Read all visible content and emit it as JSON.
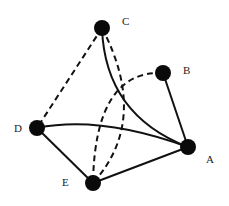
{
  "diagram": {
    "type": "graph",
    "nodes": [
      {
        "id": "A",
        "label": "A",
        "x": 188,
        "y": 147,
        "lx": 206,
        "ly": 163
      },
      {
        "id": "B",
        "label": "B",
        "x": 163,
        "y": 73,
        "lx": 183,
        "ly": 74
      },
      {
        "id": "C",
        "label": "C",
        "x": 102,
        "y": 28,
        "lx": 122,
        "ly": 25
      },
      {
        "id": "D",
        "label": "D",
        "x": 37,
        "y": 128,
        "lx": 14,
        "ly": 132
      },
      {
        "id": "E",
        "label": "E",
        "x": 93,
        "y": 183,
        "lx": 62,
        "ly": 186
      }
    ],
    "edges": [
      {
        "from": "D",
        "to": "A",
        "style": "solid"
      },
      {
        "from": "D",
        "to": "E",
        "style": "solid"
      },
      {
        "from": "E",
        "to": "A",
        "style": "solid"
      },
      {
        "from": "B",
        "to": "A",
        "style": "solid"
      },
      {
        "from": "C",
        "to": "A",
        "style": "solid"
      },
      {
        "from": "C",
        "to": "D",
        "style": "dashed"
      },
      {
        "from": "C",
        "to": "E",
        "style": "dashed"
      },
      {
        "from": "B",
        "to": "E",
        "style": "dashed"
      }
    ],
    "colors": {
      "node": "#0a0a0a",
      "edge": "#111111"
    }
  }
}
